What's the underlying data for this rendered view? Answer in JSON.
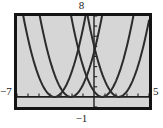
{
  "figure": {
    "kind": "graphing-calculator-screen",
    "background_color": "#ffffff",
    "screen_fill": "#d6d6d6",
    "frame_color": "#141414",
    "curve_color": "#2b2b2b"
  },
  "labels": {
    "ymax": "8",
    "ymin": "−1",
    "xmin": "−7",
    "xmax": "5"
  },
  "chart_data": {
    "type": "line",
    "title": "",
    "xlabel": "",
    "ylabel": "",
    "xlim": [
      -7,
      5
    ],
    "ylim": [
      -1,
      8
    ],
    "grid": false,
    "legend": "none",
    "tick_marks": {
      "x_step": 1,
      "y_step": 1,
      "style": "hash-marks on axes"
    },
    "annotations": [
      {
        "text": "8",
        "position": "top-center",
        "meaning": "Ymax"
      },
      {
        "text": "−1",
        "position": "bottom-center",
        "meaning": "Ymin"
      },
      {
        "text": "−7",
        "position": "left-of-x-axis",
        "meaning": "Xmin"
      },
      {
        "text": "5",
        "position": "right-of-x-axis",
        "meaning": "Xmax"
      }
    ],
    "series": [
      {
        "name": "parabola-1",
        "equation": "y = (x + 3.6)^2",
        "vertex": [
          -3.6,
          0
        ],
        "leading_coefficient": 1,
        "values": []
      },
      {
        "name": "parabola-2",
        "equation": "y = (x + 2.1)^2",
        "vertex": [
          -2.1,
          0
        ],
        "leading_coefficient": 1,
        "values": []
      },
      {
        "name": "parabola-3",
        "equation": "y = (x - 0.75)^2",
        "vertex": [
          0.75,
          0
        ],
        "leading_coefficient": 1,
        "values": []
      },
      {
        "name": "parabola-4",
        "equation": "y = (x - 2.25)^2",
        "vertex": [
          2.25,
          0
        ],
        "leading_coefficient": 1,
        "values": []
      }
    ]
  }
}
